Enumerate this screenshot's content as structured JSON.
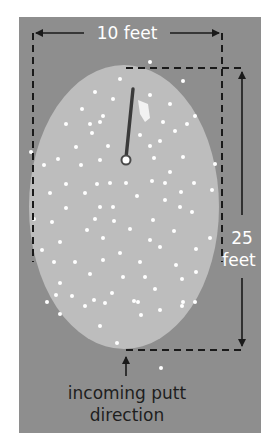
{
  "diagram": {
    "width_label": "10 feet",
    "length_label_line1": "25",
    "length_label_line2": "feet",
    "putt_label_line1": "incoming putt",
    "putt_label_line2": "direction"
  },
  "colors": {
    "background": "#8e8e8e",
    "green": "#bdbdbd",
    "dots": "#ffffff",
    "lines": "#1a1a1a",
    "flag": "#f2f2f2"
  }
}
